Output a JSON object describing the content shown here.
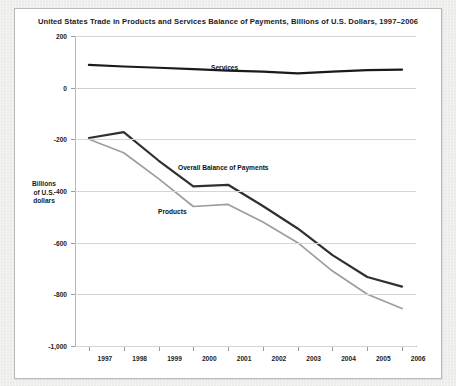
{
  "chart_data": {
    "type": "line",
    "title": "United States Trade in Products and Services Balance of Payments, Billions of U.S. Dollars, 1997–2006",
    "xlabel": "",
    "ylabel": "Billions of U.S. dollars",
    "ylabel_lines": [
      "Billions",
      "of U.S.",
      "dollars"
    ],
    "x": [
      1997,
      1998,
      1999,
      2000,
      2001,
      2002,
      2003,
      2004,
      2005,
      2006
    ],
    "categories": [
      "1997",
      "1998",
      "1999",
      "2000",
      "2001",
      "2002",
      "2003",
      "2004",
      "2005",
      "2006"
    ],
    "xtick_labels": [
      "1997",
      "1998",
      "1999",
      "2000",
      "2001",
      "2002",
      "2003",
      "2004",
      "2005",
      "2006"
    ],
    "ytick_labels": [
      "200",
      "0",
      "-200",
      "-400",
      "-600",
      "-800",
      "-1,000"
    ],
    "ytick_values": [
      200,
      0,
      -200,
      -400,
      -600,
      -800,
      -1000
    ],
    "ylim": [
      -1000,
      200
    ],
    "xlim": [
      1996.6,
      2006.4
    ],
    "grid": true,
    "legend": "inline-labels",
    "series": [
      {
        "name": "Services",
        "color": "#1a1a1a",
        "label_text": "Services",
        "values": [
          88,
          82,
          77,
          72,
          66,
          62,
          55,
          62,
          68,
          70
        ]
      },
      {
        "name": "Overall Balance of Payments",
        "color": "#303030",
        "label_text": "Overall Balance of Payments",
        "values": [
          -195,
          -172,
          -282,
          -382,
          -376,
          -458,
          -545,
          -648,
          -733,
          -770
        ]
      },
      {
        "name": "Products",
        "color": "#9d9d9d",
        "label_text": "Products",
        "values": [
          -200,
          -252,
          -352,
          -460,
          -452,
          -520,
          -600,
          -710,
          -800,
          -855
        ]
      }
    ]
  },
  "colors": {
    "page_background": "#efefed",
    "card_background": "#ffffff",
    "card_border": "#b9b9b7",
    "gridline": "#d5d5d5",
    "axis": "#b6b6b6",
    "text": "#1b1b1b",
    "series_services": "#1a1a1a",
    "series_overall": "#303030",
    "series_products": "#9d9d9d"
  }
}
